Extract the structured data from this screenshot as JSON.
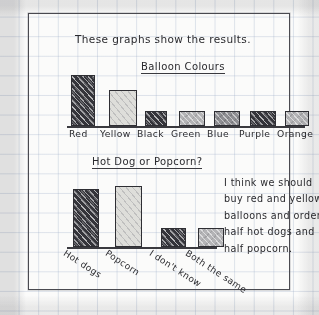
{
  "page": {
    "intro_text": "These graphs show the results.",
    "paper": "squared-exercise-book",
    "ink_color": "#2a2a2e",
    "frame_color": "#4a4a50"
  },
  "conclusion_note": {
    "name": "handwritten-conclusion",
    "lines": [
      "I think we should",
      "buy red and yellow",
      "balloons and order",
      "half hot dogs and",
      "half popcorn."
    ]
  },
  "chart_data": [
    {
      "type": "bar",
      "title": "Balloon Colours",
      "xlabel": "",
      "ylabel": "",
      "grid": true,
      "legend": "none",
      "categories": [
        "Red",
        "Yellow",
        "Black",
        "Green",
        "Blue",
        "Purple",
        "Orange"
      ],
      "values": [
        10,
        7,
        3,
        3,
        3,
        3,
        3
      ],
      "ylim": [
        0,
        11
      ],
      "bar_shading": [
        "dark",
        "light",
        "dark",
        "mid-light",
        "mid",
        "dark",
        "mid-light"
      ]
    },
    {
      "type": "bar",
      "title": "Hot Dog or Popcorn?",
      "xlabel": "",
      "ylabel": "",
      "grid": true,
      "legend": "none",
      "categories": [
        "Hot dogs",
        "Popcorn",
        "I don't know",
        "Both the same"
      ],
      "values": [
        9,
        9.5,
        3,
        3
      ],
      "ylim": [
        0,
        11
      ],
      "bar_shading": [
        "dark",
        "light",
        "dark",
        "mid-light"
      ]
    }
  ]
}
